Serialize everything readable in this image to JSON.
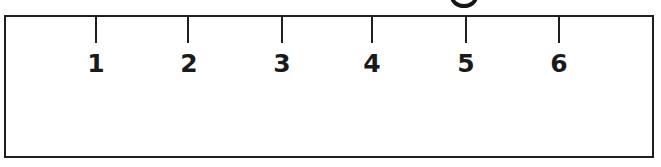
{
  "page": {
    "background_color": "#ffffff",
    "line_color": "#1f1f1f",
    "text_color": "#1a1a1a"
  },
  "ruler": {
    "type": "measurement-scale",
    "tick_labels": [
      "1",
      "2",
      "3",
      "4",
      "5",
      "6"
    ],
    "tick_count": 6
  },
  "marks": {
    "partial_circle_mark": "cropped-circle-mark"
  }
}
